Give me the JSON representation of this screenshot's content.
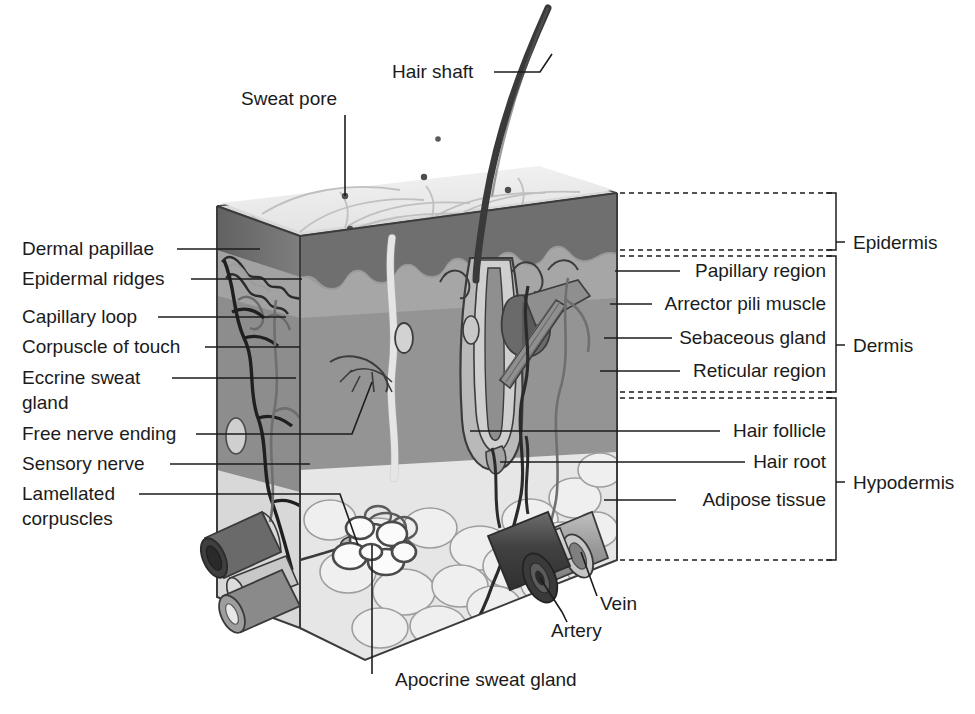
{
  "figure": {
    "background_color": "#ffffff"
  },
  "labels_top": [
    {
      "id": "hair-shaft",
      "text": "Hair shaft",
      "x": 392,
      "y": 78,
      "anchor": "start"
    },
    {
      "id": "sweat-pore",
      "text": "Sweat pore",
      "x": 241,
      "y": 105,
      "anchor": "start"
    }
  ],
  "labels_left": [
    {
      "id": "dermal-papillae",
      "text": "Dermal papillae",
      "x": 22,
      "y": 255,
      "anchor": "start"
    },
    {
      "id": "epidermal-ridges",
      "text": "Epidermal ridges",
      "x": 22,
      "y": 285,
      "anchor": "start"
    },
    {
      "id": "capillary-loop",
      "text": "Capillary loop",
      "x": 22,
      "y": 323,
      "anchor": "start"
    },
    {
      "id": "corpuscle-of-touch",
      "text": "Corpuscle of touch",
      "x": 22,
      "y": 353,
      "anchor": "start"
    },
    {
      "id": "eccrine-sweat-gland-l1",
      "text": "Eccrine sweat",
      "x": 22,
      "y": 384,
      "anchor": "start"
    },
    {
      "id": "eccrine-sweat-gland-l2",
      "text": "gland",
      "x": 22,
      "y": 409,
      "anchor": "start"
    },
    {
      "id": "free-nerve-ending",
      "text": "Free nerve ending",
      "x": 22,
      "y": 440,
      "anchor": "start"
    },
    {
      "id": "sensory-nerve",
      "text": "Sensory nerve",
      "x": 22,
      "y": 470,
      "anchor": "start"
    },
    {
      "id": "lamellated-corpuscles-l1",
      "text": "Lamellated",
      "x": 22,
      "y": 500,
      "anchor": "start"
    },
    {
      "id": "lamellated-corpuscles-l2",
      "text": "corpuscles",
      "x": 22,
      "y": 525,
      "anchor": "start"
    }
  ],
  "labels_right": [
    {
      "id": "papillary-region",
      "text": "Papillary region",
      "x": 826,
      "y": 277,
      "anchor": "end"
    },
    {
      "id": "arrector-pili-muscle",
      "text": "Arrector pili muscle",
      "x": 826,
      "y": 310,
      "anchor": "end"
    },
    {
      "id": "sebaceous-gland",
      "text": "Sebaceous gland",
      "x": 826,
      "y": 344,
      "anchor": "end"
    },
    {
      "id": "reticular-region",
      "text": "Reticular region",
      "x": 826,
      "y": 377,
      "anchor": "end"
    },
    {
      "id": "hair-follicle",
      "text": "Hair follicle",
      "x": 826,
      "y": 437,
      "anchor": "end"
    },
    {
      "id": "hair-root",
      "text": "Hair root",
      "x": 826,
      "y": 468,
      "anchor": "end"
    },
    {
      "id": "adipose-tissue",
      "text": "Adipose tissue",
      "x": 826,
      "y": 506,
      "anchor": "end"
    }
  ],
  "labels_bottom": [
    {
      "id": "vein",
      "text": "Vein",
      "x": 600,
      "y": 610,
      "anchor": "start"
    },
    {
      "id": "artery",
      "text": "Artery",
      "x": 551,
      "y": 637,
      "anchor": "start"
    },
    {
      "id": "apocrine-sweat-gland",
      "text": "Apocrine sweat gland",
      "x": 395,
      "y": 686,
      "anchor": "start"
    }
  ],
  "layer_brackets": [
    {
      "id": "epidermis",
      "text": "Epidermis",
      "label_x": 853,
      "label_y": 245,
      "top": 193,
      "bottom": 249,
      "x": 838
    },
    {
      "id": "dermis",
      "text": "Dermis",
      "label_x": 853,
      "label_y": 350,
      "top": 257,
      "bottom": 391,
      "x": 838
    },
    {
      "id": "hypodermis",
      "text": "Hypodermis",
      "label_x": 853,
      "label_y": 487,
      "top": 399,
      "bottom": 560,
      "x": 838
    }
  ],
  "layer_boundaries": [
    {
      "id": "epidermis-dermis-boundary",
      "y": 253,
      "x1": 617,
      "x2": 836
    },
    {
      "id": "dermis-hypodermis-boundary",
      "y": 395,
      "x1": 617,
      "x2": 836
    },
    {
      "id": "epidermis-top-boundary",
      "y": 193,
      "x1": 617,
      "x2": 836
    },
    {
      "id": "hypodermis-bottom-boundary",
      "y": 560,
      "x1": 617,
      "x2": 836
    }
  ],
  "palette": {
    "epidermis_surface": "#e9e9e9",
    "epidermis_top_light": "#f1f1f1",
    "epidermis_band_dark": "#6e6e6e",
    "dermis_fill": "#9a9a9a",
    "dermis_left_face": "#8d8d8d",
    "papillary_light": "#b4b4b4",
    "hypodermis_adipose": "#e4e4e4",
    "hair_dark": "#3a3a3a",
    "artery_dark": "#4a4a4a",
    "vein_mid": "#8c8c8c",
    "eccrine_duct_white": "#fdfdfd",
    "outline": "#3c3c3c",
    "text": "#1b1b1b"
  },
  "structures": [
    {
      "id": "hair-shaft",
      "kind": "hair"
    },
    {
      "id": "hair-follicle",
      "kind": "follicle"
    },
    {
      "id": "hair-root",
      "kind": "root"
    },
    {
      "id": "sebaceous-gland",
      "kind": "gland"
    },
    {
      "id": "arrector-pili-muscle",
      "kind": "muscle"
    },
    {
      "id": "eccrine-sweat-gland",
      "kind": "gland"
    },
    {
      "id": "apocrine-sweat-gland",
      "kind": "gland"
    },
    {
      "id": "lamellated-corpuscles",
      "kind": "corpuscle"
    },
    {
      "id": "corpuscle-of-touch",
      "kind": "corpuscle"
    },
    {
      "id": "artery",
      "kind": "vessel"
    },
    {
      "id": "vein",
      "kind": "vessel"
    },
    {
      "id": "sensory-nerve",
      "kind": "nerve"
    },
    {
      "id": "free-nerve-ending",
      "kind": "nerve"
    },
    {
      "id": "capillary-loop",
      "kind": "vessel"
    },
    {
      "id": "dermal-papillae",
      "kind": "interface"
    },
    {
      "id": "epidermal-ridges",
      "kind": "interface"
    },
    {
      "id": "adipose-tissue",
      "kind": "tissue"
    }
  ]
}
